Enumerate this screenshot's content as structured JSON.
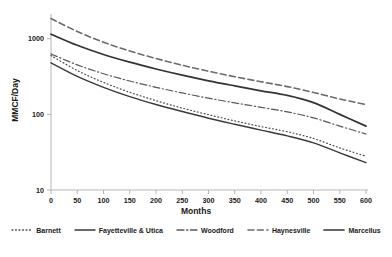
{
  "chart_data": {
    "type": "line",
    "title": "",
    "xlabel": "Months",
    "ylabel": "MMCF/Day",
    "xlim": [
      0,
      600
    ],
    "ylim": [
      10,
      2000
    ],
    "yscale": "log",
    "grid": false,
    "legend_position": "bottom",
    "xticks": [
      0,
      50,
      100,
      150,
      200,
      250,
      300,
      350,
      400,
      450,
      500,
      550,
      600
    ],
    "yticks": [
      10,
      100,
      1000
    ],
    "ytick_labels": [
      "10",
      "100",
      "1000"
    ],
    "x": [
      0,
      50,
      100,
      150,
      200,
      250,
      300,
      350,
      400,
      450,
      500,
      550,
      600
    ],
    "series": [
      {
        "name": "Barnett",
        "style": "dotted",
        "color": "#4d4d4d",
        "width": 1.2,
        "values": [
          600,
          380,
          265,
          196,
          152,
          121,
          99,
          82,
          69,
          59,
          48,
          36,
          28
        ]
      },
      {
        "name": "Fayetteville & Utica",
        "style": "solid",
        "color": "#3a3a3a",
        "width": 1.4,
        "values": [
          480,
          318,
          228,
          172,
          135,
          109,
          89,
          74,
          62,
          52,
          42,
          31,
          23
        ]
      },
      {
        "name": "Woodford",
        "style": "dashdot",
        "color": "#595959",
        "width": 1.2,
        "values": [
          630,
          452,
          345,
          276,
          228,
          192,
          164,
          142,
          124,
          108,
          90,
          70,
          55
        ]
      },
      {
        "name": "Haynesville",
        "style": "dashed",
        "color": "#6b6b6b",
        "width": 1.6,
        "values": [
          1850,
          1250,
          900,
          690,
          548,
          447,
          372,
          315,
          270,
          233,
          195,
          160,
          135
        ]
      },
      {
        "name": "Marcellus",
        "style": "solid",
        "color": "#333333",
        "width": 1.7,
        "values": [
          1150,
          820,
          620,
          490,
          398,
          330,
          278,
          238,
          205,
          178,
          143,
          100,
          70
        ]
      }
    ]
  },
  "axes": {
    "x_title": "Months",
    "y_title": "MMCF/Day"
  },
  "legend": {
    "items": [
      {
        "label": "Barnett"
      },
      {
        "label": "Fayetteville & Utica"
      },
      {
        "label": "Woodford"
      },
      {
        "label": "Haynesville"
      },
      {
        "label": "Marcellus"
      }
    ]
  }
}
